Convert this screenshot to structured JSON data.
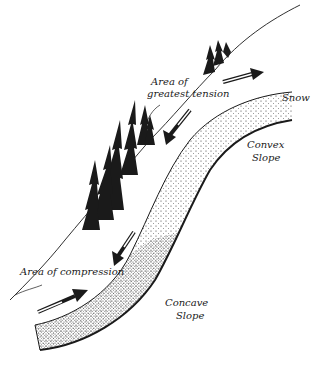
{
  "diagram": {
    "type": "illustration",
    "labels": {
      "tension": [
        "Area of",
        "greatest tension"
      ],
      "snow": "Snow",
      "convex": [
        "Convex",
        "Slope"
      ],
      "compression": "Area of compression",
      "concave": [
        "Concave",
        "Slope"
      ]
    },
    "arrows": [
      {
        "name": "tension-arrow-upslope",
        "direction": "up-right"
      },
      {
        "name": "tension-arrow-downslope",
        "direction": "down-left"
      },
      {
        "name": "compression-arrow-upper",
        "direction": "down-left"
      },
      {
        "name": "compression-arrow-lower",
        "direction": "up-right"
      }
    ],
    "colors": {
      "ink": "#1a1a1a",
      "background": "#ffffff",
      "stipple": "#333333"
    }
  }
}
